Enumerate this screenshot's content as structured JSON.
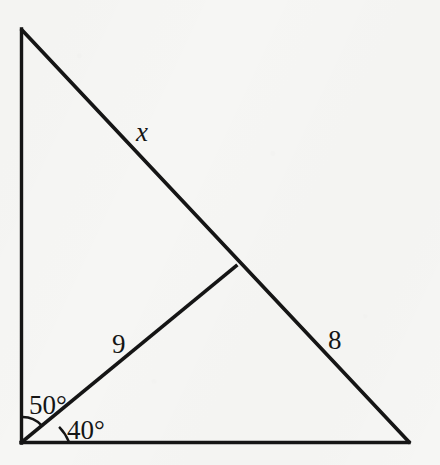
{
  "figure": {
    "kind": "geometry-diagram",
    "background_color": "#f6f6f4",
    "stroke_color": "#151515",
    "text_color": "#151515",
    "canvas": {
      "width": 440,
      "height": 465
    },
    "points": {
      "top_vertex": {
        "x": 21,
        "y": 29
      },
      "bottom_left_vertex": {
        "x": 21,
        "y": 443
      },
      "bottom_right_vertex": {
        "x": 409,
        "y": 442
      },
      "hypotenuse_junction": {
        "x": 236,
        "y": 266
      }
    },
    "segments": [
      {
        "name": "left-vertical-leg",
        "from": "top_vertex",
        "to": "bottom_left_vertex"
      },
      {
        "name": "bottom-horizontal-leg",
        "from": "bottom_left_vertex",
        "to": "bottom_right_vertex"
      },
      {
        "name": "hypotenuse",
        "from": "top_vertex",
        "to": "bottom_right_vertex"
      },
      {
        "name": "cevian-segment",
        "from": "bottom_left_vertex",
        "to": "hypotenuse_junction"
      }
    ],
    "labels": [
      {
        "name": "side-label-x",
        "text": "x",
        "style": "italic",
        "x": 143,
        "y": 133,
        "describes": "hypotenuse upper portion"
      },
      {
        "name": "side-label-9",
        "text": "9",
        "style": "upright",
        "x": 120,
        "y": 345,
        "describes": "cevian-segment"
      },
      {
        "name": "side-label-8",
        "text": "8",
        "style": "upright",
        "x": 335,
        "y": 341,
        "describes": "hypotenuse lower portion"
      },
      {
        "name": "angle-label-50",
        "text": "50°",
        "style": "upright",
        "x": 52,
        "y": 405,
        "describes": "angle between left leg and cevian"
      },
      {
        "name": "angle-label-40",
        "text": "40°",
        "style": "upright",
        "x": 90,
        "y": 430,
        "describes": "angle between cevian and base"
      }
    ],
    "angle_arcs": [
      {
        "name": "arc-50-degrees",
        "vertex": "bottom_left_vertex",
        "radius": 26,
        "value": "50°"
      },
      {
        "name": "arc-40-degrees",
        "vertex": "bottom_left_vertex",
        "radius": 48,
        "value": "40°"
      }
    ]
  }
}
